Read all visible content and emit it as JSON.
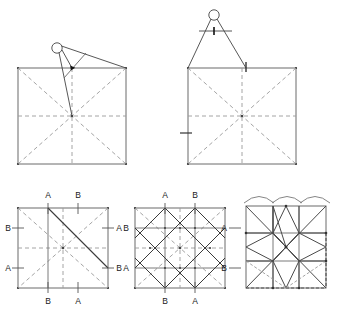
{
  "figure": {
    "background_color": "#ffffff",
    "line_color": "#555555",
    "dashed_color": "#9a9a9a",
    "solid_dark_color": "#3a3a3a",
    "label_color": "#1a1a1a",
    "panel_count": 5
  },
  "panels": [
    {
      "id": "panel-top-left",
      "name": "square-with-compass-pivot",
      "description": "Square with dashed diagonals and dashed midlines; compass set on the top edge near center-left",
      "square": {
        "x": 18,
        "y": 68,
        "width": 108,
        "height": 96
      },
      "tool": "compass",
      "guides": [
        "diagonal",
        "diagonal",
        "vertical-midline",
        "horizontal-midline"
      ],
      "tick_marks": []
    },
    {
      "id": "panel-top-right",
      "name": "square-with-compass-span",
      "description": "Square with dashed diagonals and midlines; compass spanning from left corner to top midpoint, with crossbar and tick marks",
      "square": {
        "x": 188,
        "y": 68,
        "width": 108,
        "height": 96
      },
      "tool": "compass",
      "guides": [
        "diagonal",
        "diagonal",
        "vertical-midline",
        "horizontal-midline"
      ],
      "tick_marks": [
        "top-edge-tick",
        "left-edge-tick",
        "crossbar-tick"
      ]
    },
    {
      "id": "panel-bottom-left",
      "name": "marked-square-step-one",
      "description": "Square marked with A and B reference points on all four edges, one solid diagonal drawn from top A to right B",
      "square": {
        "x": 18,
        "y": 208,
        "width": 90,
        "height": 80
      },
      "labels": [
        {
          "text": "A",
          "edge": "top",
          "position": "left-of-center"
        },
        {
          "text": "B",
          "edge": "top",
          "position": "right-of-center"
        },
        {
          "text": "B",
          "edge": "left",
          "position": "upper"
        },
        {
          "text": "A",
          "edge": "left",
          "position": "lower"
        },
        {
          "text": "A",
          "edge": "right",
          "position": "upper"
        },
        {
          "text": "B",
          "edge": "right",
          "position": "lower"
        },
        {
          "text": "B",
          "edge": "bottom",
          "position": "left-of-center"
        },
        {
          "text": "A",
          "edge": "bottom",
          "position": "right-of-center"
        }
      ]
    },
    {
      "id": "panel-bottom-middle",
      "name": "marked-square-step-two",
      "description": "Square with complete grid of connecting lines between all A and B points forming the star construction lattice",
      "square": {
        "x": 135,
        "y": 208,
        "width": 90,
        "height": 80
      },
      "labels": [
        {
          "text": "A",
          "edge": "top",
          "position": "left-of-center"
        },
        {
          "text": "B",
          "edge": "top",
          "position": "right-of-center"
        },
        {
          "text": "B",
          "edge": "left",
          "position": "upper"
        },
        {
          "text": "A",
          "edge": "left",
          "position": "lower"
        },
        {
          "text": "A",
          "edge": "right",
          "position": "upper"
        },
        {
          "text": "B",
          "edge": "right",
          "position": "lower"
        },
        {
          "text": "B",
          "edge": "bottom",
          "position": "left-of-center"
        },
        {
          "text": "A",
          "edge": "bottom",
          "position": "right-of-center"
        }
      ]
    },
    {
      "id": "panel-bottom-right",
      "name": "finished-star-block",
      "description": "Completed eight-pointed LeMoyne star block with corner squares and side triangles; three scalloped arcs above; dashed seam lines on lower-left and right",
      "square": {
        "x": 246,
        "y": 208,
        "width": 80,
        "height": 80
      },
      "scallop_count": 3,
      "star_points": 8,
      "seam_guides": [
        "bottom-dashed",
        "right-dashed",
        "lower-left-dashed"
      ]
    }
  ],
  "labels": {
    "a": "A",
    "b": "B"
  }
}
